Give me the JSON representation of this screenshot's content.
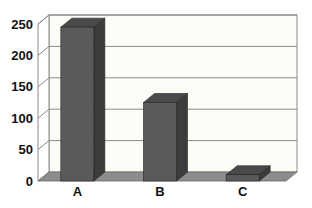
{
  "chart_data": {
    "type": "bar",
    "style": "3d-column",
    "title": "",
    "xlabel": "",
    "ylabel": "",
    "categories": [
      "A",
      "B",
      "C"
    ],
    "values": [
      245,
      125,
      10
    ],
    "ylim": [
      0,
      250
    ],
    "yticks": [
      0,
      50,
      100,
      150,
      200,
      250
    ],
    "ytick_labels": [
      "0",
      "50",
      "100",
      "150",
      "200",
      "250"
    ],
    "grid": true,
    "legend": null,
    "colors": {
      "bar_front": "#5a5a5a",
      "bar_side": "#3c3c3c",
      "bar_top": "#4a4a4a",
      "floor": "#8c8c8c",
      "wall": "#fdfdf8",
      "gridline": "#8a8a8a"
    }
  }
}
